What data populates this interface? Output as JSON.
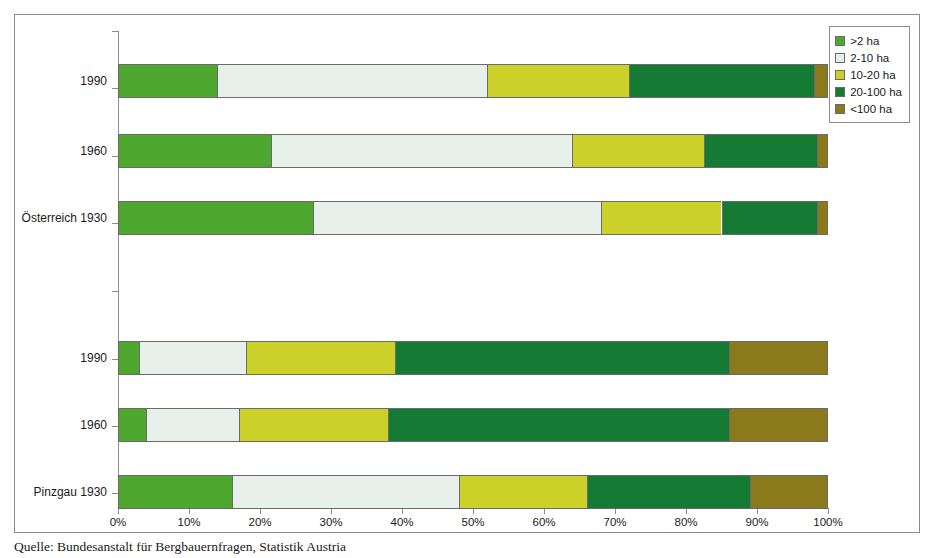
{
  "top_strip": "",
  "caption": "Quelle: Bundesanstalt für Bergbauernfragen, Statistik Austria",
  "legend": {
    "position": "top-right",
    "items": [
      {
        "label": ">2 ha",
        "color": "#4ea72e"
      },
      {
        "label": "2-10 ha",
        "color": "#e8f0ec"
      },
      {
        "label": "10-20 ha",
        "color": "#ccd12a"
      },
      {
        "label": "20-100 ha",
        "color": "#157a34"
      },
      {
        "label": "<100 ha",
        "color": "#8a7a1c"
      }
    ]
  },
  "axis": {
    "x_ticks": [
      "0%",
      "10%",
      "20%",
      "30%",
      "40%",
      "50%",
      "60%",
      "70%",
      "80%",
      "90%",
      "100%"
    ],
    "x_values": [
      0,
      10,
      20,
      30,
      40,
      50,
      60,
      70,
      80,
      90,
      100
    ],
    "y_categories": [
      "1990",
      "1960",
      "Österreich 1930",
      "1990",
      "1960",
      "Pinzgau 1930"
    ]
  },
  "chart_data": {
    "type": "bar",
    "orientation": "horizontal",
    "stacked": true,
    "stack_mode": "percent",
    "title": "",
    "xlabel": "",
    "ylabel": "",
    "xlim": [
      0,
      100
    ],
    "grid": false,
    "legend_position": "top-right",
    "categories": [
      "Pinzgau 1930",
      "Pinzgau 1960",
      "Pinzgau 1990",
      "Österreich 1930",
      "Österreich 1960",
      "Österreich 1990"
    ],
    "series": [
      {
        "name": ">2 ha",
        "color": "#4ea72e",
        "values": [
          16,
          4,
          3,
          27.5,
          21.5,
          14
        ]
      },
      {
        "name": "2-10 ha",
        "color": "#e8f0ec",
        "values": [
          32,
          13,
          15,
          40.5,
          42.5,
          38
        ]
      },
      {
        "name": "10-20 ha",
        "color": "#ccd12a",
        "values": [
          18,
          21,
          21,
          17,
          18.5,
          20
        ]
      },
      {
        "name": "20-100 ha",
        "color": "#157a34",
        "values": [
          23,
          48,
          47,
          13.5,
          16,
          26
        ]
      },
      {
        "name": "<100 ha",
        "color": "#8a7a1c",
        "values": [
          11,
          14,
          14,
          1.5,
          1.5,
          2
        ]
      }
    ]
  },
  "bars": [
    {
      "label": "1990",
      "group": "Österreich",
      "segments": [
        {
          "name": ">2 ha",
          "start": 0,
          "end": 14,
          "color": "#4ea72e"
        },
        {
          "name": "2-10 ha",
          "start": 14,
          "end": 52,
          "color": "#e8f0ec"
        },
        {
          "name": "10-20 ha",
          "start": 52,
          "end": 72,
          "color": "#ccd12a"
        },
        {
          "name": "20-100 ha",
          "start": 72,
          "end": 98,
          "color": "#157a34"
        },
        {
          "name": "<100 ha",
          "start": 98,
          "end": 100,
          "color": "#8a7a1c"
        }
      ]
    },
    {
      "label": "1960",
      "group": "Österreich",
      "segments": [
        {
          "name": ">2 ha",
          "start": 0,
          "end": 21.5,
          "color": "#4ea72e"
        },
        {
          "name": "2-10 ha",
          "start": 21.5,
          "end": 64,
          "color": "#e8f0ec"
        },
        {
          "name": "10-20 ha",
          "start": 64,
          "end": 82.5,
          "color": "#ccd12a"
        },
        {
          "name": "20-100 ha",
          "start": 82.5,
          "end": 98.5,
          "color": "#157a34"
        },
        {
          "name": "<100 ha",
          "start": 98.5,
          "end": 100,
          "color": "#8a7a1c"
        }
      ]
    },
    {
      "label": "Österreich 1930",
      "group": "Österreich",
      "segments": [
        {
          "name": ">2 ha",
          "start": 0,
          "end": 27.5,
          "color": "#4ea72e"
        },
        {
          "name": "2-10 ha",
          "start": 27.5,
          "end": 68,
          "color": "#e8f0ec"
        },
        {
          "name": "10-20 ha",
          "start": 68,
          "end": 85,
          "color": "#ccd12a"
        },
        {
          "name": "20-100 ha",
          "start": 85,
          "end": 98.5,
          "color": "#157a34"
        },
        {
          "name": "<100 ha",
          "start": 98.5,
          "end": 100,
          "color": "#8a7a1c"
        }
      ]
    },
    {
      "label": "1990",
      "group": "Pinzgau",
      "segments": [
        {
          "name": ">2 ha",
          "start": 0,
          "end": 3,
          "color": "#4ea72e"
        },
        {
          "name": "2-10 ha",
          "start": 3,
          "end": 18,
          "color": "#e8f0ec"
        },
        {
          "name": "10-20 ha",
          "start": 18,
          "end": 39,
          "color": "#ccd12a"
        },
        {
          "name": "20-100 ha",
          "start": 39,
          "end": 86,
          "color": "#157a34"
        },
        {
          "name": "<100 ha",
          "start": 86,
          "end": 100,
          "color": "#8a7a1c"
        }
      ]
    },
    {
      "label": "1960",
      "group": "Pinzgau",
      "segments": [
        {
          "name": ">2 ha",
          "start": 0,
          "end": 4,
          "color": "#4ea72e"
        },
        {
          "name": "2-10 ha",
          "start": 4,
          "end": 17,
          "color": "#e8f0ec"
        },
        {
          "name": "10-20 ha",
          "start": 17,
          "end": 38,
          "color": "#ccd12a"
        },
        {
          "name": "20-100 ha",
          "start": 38,
          "end": 86,
          "color": "#157a34"
        },
        {
          "name": "<100 ha",
          "start": 86,
          "end": 100,
          "color": "#8a7a1c"
        }
      ]
    },
    {
      "label": "Pinzgau 1930",
      "group": "Pinzgau",
      "segments": [
        {
          "name": ">2 ha",
          "start": 0,
          "end": 16,
          "color": "#4ea72e"
        },
        {
          "name": "2-10 ha",
          "start": 16,
          "end": 48,
          "color": "#e8f0ec"
        },
        {
          "name": "10-20 ha",
          "start": 48,
          "end": 66,
          "color": "#ccd12a"
        },
        {
          "name": "20-100 ha",
          "start": 66,
          "end": 89,
          "color": "#157a34"
        },
        {
          "name": "<100 ha",
          "start": 89,
          "end": 100,
          "color": "#8a7a1c"
        }
      ]
    }
  ],
  "layout": {
    "bar_tops": [
      33,
      103,
      170,
      310,
      377,
      444
    ],
    "tick_tops": [
      16,
      73,
      141,
      208,
      276,
      344,
      411,
      478
    ]
  }
}
